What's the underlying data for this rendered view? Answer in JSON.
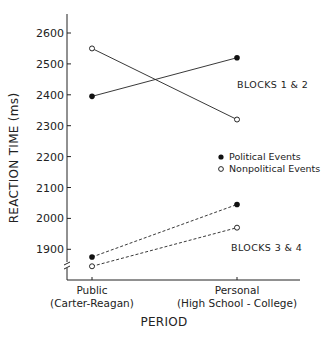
{
  "chart_data": {
    "type": "line",
    "title": "",
    "xlabel": "PERIOD",
    "ylabel": "REACTION TIME (ms)",
    "categories": [
      "Public\n(Carter-Reagan)",
      "Personal\n(High School - College)"
    ],
    "category_lines": [
      [
        "Public",
        "(Carter-Reagan)"
      ],
      [
        "Personal",
        "(High School - College)"
      ]
    ],
    "yticks": [
      1900,
      2000,
      2100,
      2200,
      2300,
      2400,
      2500,
      2600
    ],
    "ytick_labels": [
      "1900",
      "2000",
      "2100",
      "2200",
      "2300",
      "2400",
      "2500",
      "2600"
    ],
    "ylim": [
      1800,
      2650
    ],
    "axis_break": true,
    "grid": false,
    "legend_position": "right-middle",
    "legend": [
      {
        "label": "Political Events",
        "marker": "filled-circle"
      },
      {
        "label": "Nonpolitical Events",
        "marker": "open-circle"
      }
    ],
    "annotations": [
      "BLOCKS 1 & 2",
      "BLOCKS 3 & 4"
    ],
    "series": [
      {
        "name": "Political Events (Blocks 1 & 2)",
        "marker": "filled",
        "line": "solid",
        "values": [
          2395,
          2520
        ]
      },
      {
        "name": "Nonpolitical Events (Blocks 1 & 2)",
        "marker": "open",
        "line": "solid",
        "values": [
          2550,
          2320
        ]
      },
      {
        "name": "Political Events (Blocks 3 & 4)",
        "marker": "filled",
        "line": "dashed",
        "values": [
          1875,
          2045
        ]
      },
      {
        "name": "Nonpolitical Events (Blocks 3 & 4)",
        "marker": "open",
        "line": "dashed",
        "values": [
          1845,
          1970
        ]
      }
    ]
  }
}
